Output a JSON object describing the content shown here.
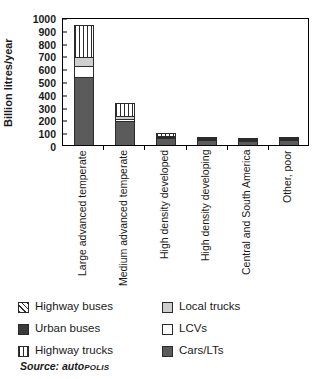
{
  "chart_data": {
    "type": "bar",
    "stacked": true,
    "title": "",
    "xlabel": "",
    "ylabel": "Billion litres/year",
    "ylim": [
      0,
      1000
    ],
    "ytick_step": 100,
    "yticks": [
      "1000",
      "900",
      "800",
      "700",
      "600",
      "500",
      "400",
      "300",
      "200",
      "100",
      "0"
    ],
    "grid": false,
    "legend_position": "below",
    "categories": [
      "Large advanced temperate",
      "Medium advanced temperate",
      "High density developed",
      "High density developing",
      "Central and South America",
      "Other, poor"
    ],
    "series": [
      {
        "name": "Cars/LTs",
        "pattern": "solid-dark-gray",
        "values": [
          530,
          185,
          55,
          38,
          33,
          38
        ]
      },
      {
        "name": "LCVs",
        "pattern": "white",
        "values": [
          90,
          20,
          8,
          2,
          2,
          2
        ]
      },
      {
        "name": "Local trucks",
        "pattern": "light-gray",
        "values": [
          70,
          25,
          10,
          2,
          2,
          2
        ]
      },
      {
        "name": "Highway trucks",
        "pattern": "vertical-stripe",
        "values": [
          250,
          100,
          22,
          2,
          2,
          2
        ]
      },
      {
        "name": "Urban buses",
        "pattern": "solid-dark",
        "values": [
          0,
          0,
          0,
          0,
          0,
          0
        ]
      },
      {
        "name": "Highway buses",
        "pattern": "diagonal-stripe",
        "values": [
          0,
          0,
          0,
          0,
          0,
          0
        ]
      }
    ],
    "bar_totals": [
      940,
      330,
      95,
      44,
      39,
      44
    ]
  },
  "legend": {
    "items": [
      {
        "label": "Highway buses",
        "swatch": "diagonal-stripe"
      },
      {
        "label": "Local trucks",
        "swatch": "light-gray"
      },
      {
        "label": "Urban buses",
        "swatch": "solid-dark"
      },
      {
        "label": "LCVs",
        "swatch": "white"
      },
      {
        "label": "Highway trucks",
        "swatch": "vertical-stripe"
      },
      {
        "label": "Cars/LTs",
        "swatch": "solid-dark-gray"
      }
    ]
  },
  "source": {
    "prefix": "Source: auto",
    "smallcaps": "POLIS"
  },
  "colors": {
    "cars": "#5b5b5b",
    "lcvs": "#ffffff",
    "local_trucks": "#cfcfcf",
    "stripe": "#2b2b2b",
    "axis": "#000000"
  }
}
